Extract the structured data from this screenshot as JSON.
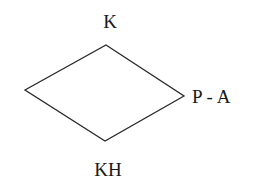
{
  "diagram": {
    "type": "rhombus",
    "nodes": {
      "top": "K",
      "right": "P - A",
      "bottom": "KH"
    },
    "line_color": "#2a2a2a",
    "text_color": "#1a1a1a"
  }
}
